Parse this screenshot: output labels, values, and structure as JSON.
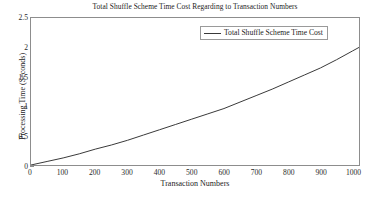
{
  "chart_data": {
    "type": "line",
    "title": "Total Shuffle Scheme Time Cost Regarding to Transaction Numbers",
    "xlabel": "Transaction Numbers",
    "ylabel": "Processing Time (Seconds)",
    "xlim": [
      0,
      1020
    ],
    "ylim": [
      0,
      2.5
    ],
    "xticks": [
      0,
      100,
      200,
      300,
      400,
      500,
      600,
      700,
      800,
      900,
      1000
    ],
    "xtick_labels": [
      "0",
      "100",
      "200",
      "300",
      "400",
      "500",
      "600",
      "700",
      "800",
      "900",
      "1000"
    ],
    "yticks": [
      0,
      0.5,
      1,
      1.5,
      2,
      2.5
    ],
    "ytick_labels": [
      "0",
      "0.5",
      "1",
      "1.5",
      "2",
      "2.5"
    ],
    "grid": false,
    "legend_position": "top-right",
    "series": [
      {
        "name": "Total Shuffle Scheme Time Cost",
        "color": "#3a3a3a",
        "x": [
          0,
          50,
          100,
          150,
          200,
          250,
          300,
          350,
          400,
          450,
          500,
          550,
          600,
          650,
          700,
          750,
          800,
          850,
          900,
          950,
          1000,
          1020
        ],
        "values": [
          0.0,
          0.06,
          0.12,
          0.19,
          0.27,
          0.34,
          0.42,
          0.51,
          0.6,
          0.69,
          0.78,
          0.87,
          0.96,
          1.07,
          1.18,
          1.29,
          1.41,
          1.53,
          1.65,
          1.79,
          1.94,
          2.0
        ]
      }
    ]
  },
  "legend": {
    "entries": [
      {
        "label": "Total Shuffle Scheme Time Cost"
      }
    ]
  }
}
